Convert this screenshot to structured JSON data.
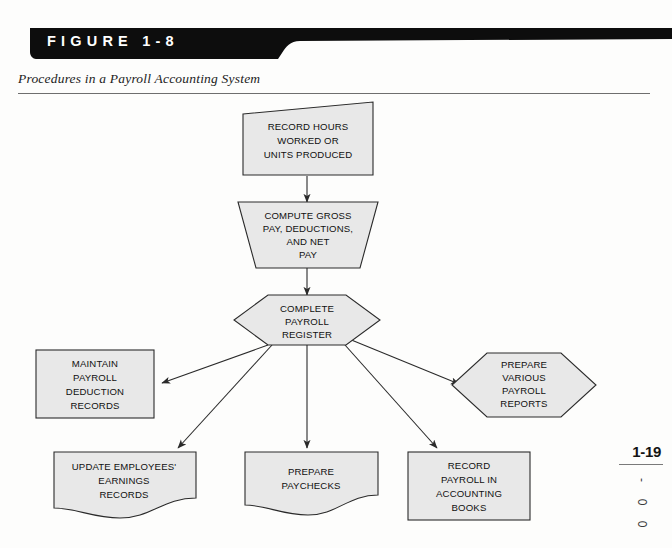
{
  "header": {
    "figure_label": "FIGURE  1-8",
    "subtitle": "Procedures in a Payroll Accounting System",
    "banner_color": "#0d0d0d"
  },
  "margin": {
    "page_number": "1-19",
    "code_chars": [
      "-",
      "0",
      "0"
    ]
  },
  "diagram": {
    "title": "Procedures in a Payroll Accounting System",
    "shape_fill": "#e8e8e8",
    "stroke_color": "#2a2a2a",
    "nodes": [
      {
        "id": "record-hours",
        "shape": "slanted-box",
        "lines": [
          "RECORD HOURS",
          "WORKED OR",
          "UNITS PRODUCED"
        ]
      },
      {
        "id": "compute-gross-pay",
        "shape": "trapezoid",
        "lines": [
          "COMPUTE GROSS",
          "PAY, DEDUCTIONS,",
          "AND NET",
          "PAY"
        ]
      },
      {
        "id": "complete-payroll-register",
        "shape": "hexagon",
        "lines": [
          "COMPLETE",
          "PAYROLL",
          "REGISTER"
        ]
      },
      {
        "id": "maintain-payroll-deduction-records",
        "shape": "rectangle",
        "lines": [
          "MAINTAIN",
          "PAYROLL",
          "DEDUCTION",
          "RECORDS"
        ]
      },
      {
        "id": "prepare-various-payroll-reports",
        "shape": "hexagon",
        "lines": [
          "PREPARE",
          "VARIOUS",
          "PAYROLL",
          "REPORTS"
        ]
      },
      {
        "id": "update-employees-earnings-records",
        "shape": "document",
        "lines": [
          "UPDATE EMPLOYEES'",
          "EARNINGS",
          "RECORDS"
        ]
      },
      {
        "id": "prepare-paychecks",
        "shape": "document",
        "lines": [
          "PREPARE",
          "PAYCHECKS"
        ]
      },
      {
        "id": "record-payroll-in-accounting-books",
        "shape": "rectangle",
        "lines": [
          "RECORD",
          "PAYROLL IN",
          "ACCOUNTING",
          "BOOKS"
        ]
      }
    ],
    "edges": [
      {
        "from": "record-hours",
        "to": "compute-gross-pay"
      },
      {
        "from": "compute-gross-pay",
        "to": "complete-payroll-register"
      },
      {
        "from": "complete-payroll-register",
        "to": "maintain-payroll-deduction-records"
      },
      {
        "from": "complete-payroll-register",
        "to": "update-employees-earnings-records"
      },
      {
        "from": "complete-payroll-register",
        "to": "prepare-paychecks"
      },
      {
        "from": "complete-payroll-register",
        "to": "record-payroll-in-accounting-books"
      },
      {
        "from": "complete-payroll-register",
        "to": "prepare-various-payroll-reports"
      }
    ]
  }
}
